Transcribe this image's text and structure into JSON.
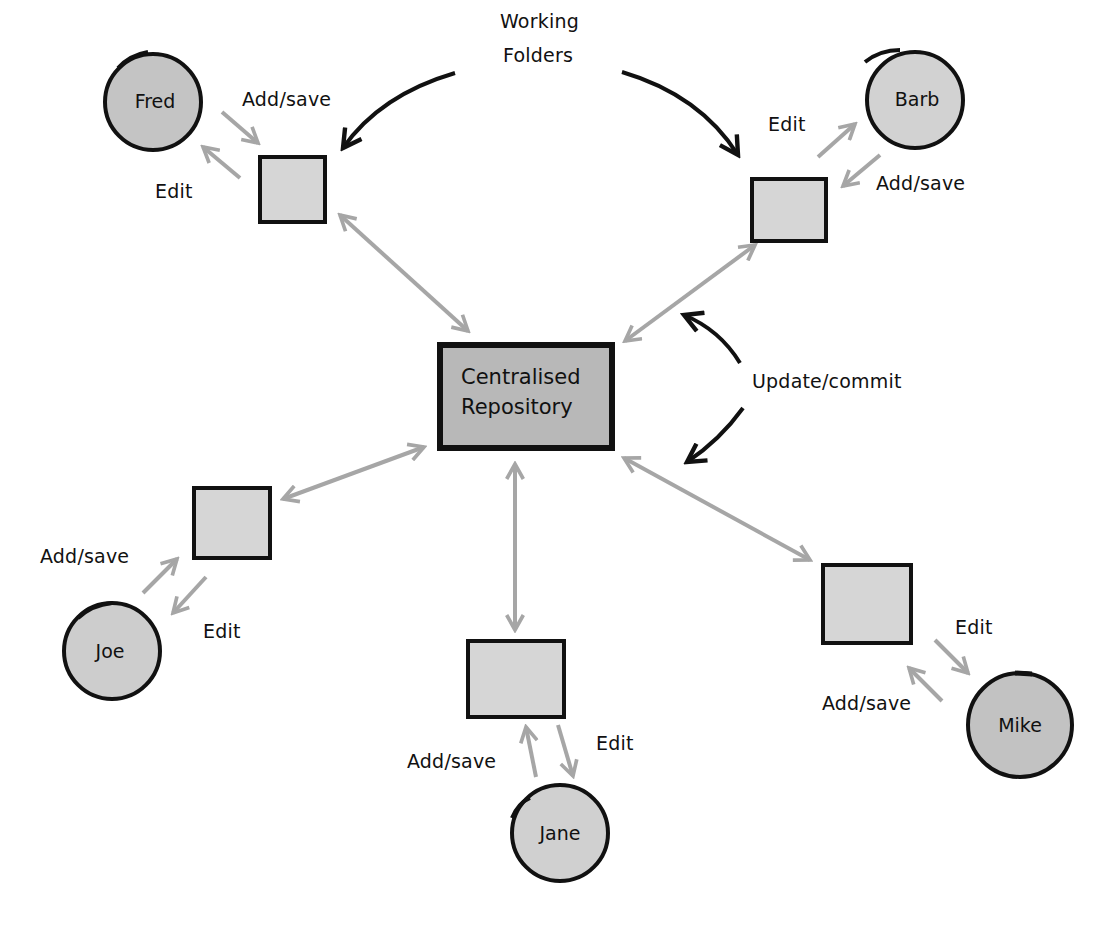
{
  "diagram": {
    "center": {
      "label_line1": "Centralised",
      "label_line2": "Repository"
    },
    "annotations": {
      "working_folders_line1": "Working",
      "working_folders_line2": "Folders",
      "update_commit": "Update/commit"
    },
    "users": [
      {
        "name": "Fred",
        "add_label": "Add/save",
        "edit_label": "Edit"
      },
      {
        "name": "Barb",
        "add_label": "Add/save",
        "edit_label": "Edit"
      },
      {
        "name": "Joe",
        "add_label": "Add/save",
        "edit_label": "Edit"
      },
      {
        "name": "Jane",
        "add_label": "Add/save",
        "edit_label": "Edit"
      },
      {
        "name": "Mike",
        "add_label": "Add/save",
        "edit_label": "Edit"
      }
    ],
    "colors": {
      "ink": "#111111",
      "arrow_gray": "#a6a6a6",
      "folder_fill": "#d6d6d6",
      "repo_fill": "#b8b8b8",
      "person_fill": "#c8c8c8"
    }
  }
}
